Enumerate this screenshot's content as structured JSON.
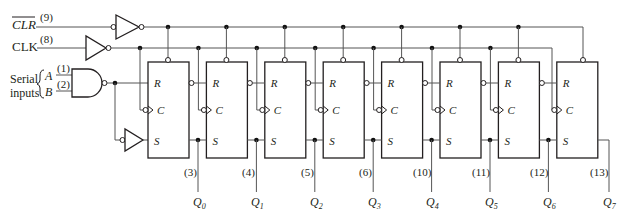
{
  "inputs": {
    "clr": {
      "label": "CLR",
      "pin": "(9)"
    },
    "clk": {
      "label": "CLK",
      "pin": "(8)"
    },
    "serial": {
      "label_line1": "Serial",
      "label_line2": "inputs",
      "a_label": "A",
      "a_pin": "(1)",
      "b_label": "B",
      "b_pin": "(2)"
    }
  },
  "flipflop_labels": {
    "r": "R",
    "c": "C",
    "s": "S"
  },
  "outputs": [
    {
      "pin": "(3)",
      "name": "Q",
      "sub": "0"
    },
    {
      "pin": "(4)",
      "name": "Q",
      "sub": "1"
    },
    {
      "pin": "(5)",
      "name": "Q",
      "sub": "2"
    },
    {
      "pin": "(6)",
      "name": "Q",
      "sub": "3"
    },
    {
      "pin": "(10)",
      "name": "Q",
      "sub": "4"
    },
    {
      "pin": "(11)",
      "name": "Q",
      "sub": "5"
    },
    {
      "pin": "(12)",
      "name": "Q",
      "sub": "6"
    },
    {
      "pin": "(13)",
      "name": "Q",
      "sub": "7"
    }
  ]
}
